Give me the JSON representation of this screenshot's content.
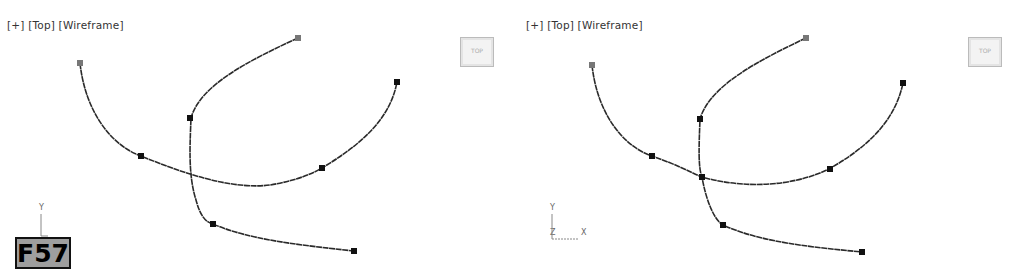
{
  "viewports": [
    {
      "id": "left",
      "label": {
        "plus": "[+]",
        "view": "[Top]",
        "shading": "[Wireframe]"
      },
      "viewcube": {
        "face": "TOP"
      },
      "gizmo": {
        "axes": [
          "Y"
        ]
      }
    },
    {
      "id": "right",
      "label": {
        "plus": "[+]",
        "view": "[Top]",
        "shading": "[Wireframe]"
      },
      "viewcube": {
        "face": "TOP"
      },
      "gizmo": {
        "axes": [
          "Y",
          "Z",
          "X"
        ]
      }
    }
  ],
  "figure_badge": "F57",
  "colors": {
    "curve": "#2a2a2a",
    "vertex": "#111111",
    "first_vertex": "#777777",
    "label_text": "#333333",
    "badge_bg": "#9e9e9e"
  }
}
